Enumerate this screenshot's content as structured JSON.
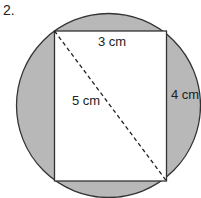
{
  "problem": {
    "number": "2."
  },
  "diagram": {
    "circle": {
      "cx": 108.5,
      "cy": 105.5,
      "r": 92,
      "fill": "#b8b8b8",
      "stroke": "#333333"
    },
    "rectangle": {
      "x": 54.5,
      "y": 31,
      "width": 112,
      "height": 150,
      "fill": "#ffffff",
      "stroke": "#333333"
    },
    "diagonal": {
      "x1": 54.5,
      "y1": 31,
      "x2": 166.5,
      "y2": 181,
      "style": "dashed"
    },
    "labels": {
      "top_side": "3 cm",
      "right_side": "4 cm",
      "diagonal": "5 cm"
    }
  }
}
